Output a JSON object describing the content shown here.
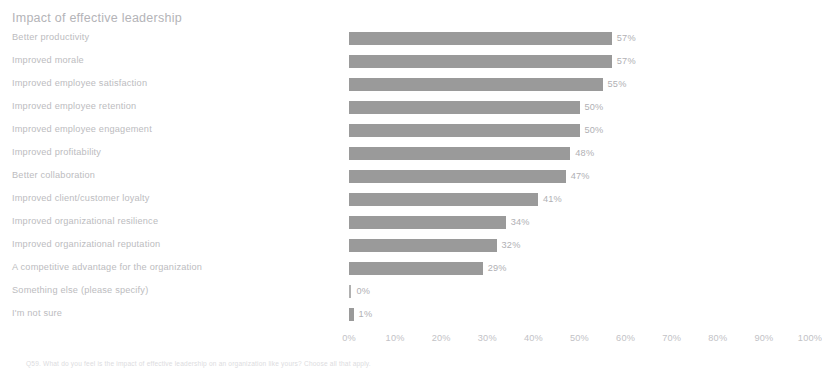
{
  "chart_data": {
    "type": "bar",
    "orientation": "horizontal",
    "title": "Impact of effective leadership",
    "xlabel": "",
    "ylabel": "",
    "xlim": [
      0,
      100
    ],
    "grid": false,
    "legend": null,
    "bar_color": "#9a9a9a",
    "categories": [
      "Better productivity",
      "Improved morale",
      "Improved employee satisfaction",
      "Improved employee retention",
      "Improved employee engagement",
      "Improved profitability",
      "Better collaboration",
      "Improved client/customer loyalty",
      "Improved organizational resilience",
      "Improved organizational reputation",
      "A competitive advantage for the organization",
      "Something else (please specify)",
      "I'm not sure"
    ],
    "values": [
      57,
      57,
      55,
      50,
      50,
      48,
      47,
      41,
      34,
      32,
      29,
      0,
      1
    ],
    "value_labels": [
      "57%",
      "57%",
      "55%",
      "50%",
      "50%",
      "48%",
      "47%",
      "41%",
      "34%",
      "32%",
      "29%",
      "0%",
      "1%"
    ],
    "xticks": [
      0,
      10,
      20,
      30,
      40,
      50,
      60,
      70,
      80,
      90,
      100
    ],
    "xtick_labels": [
      "0%",
      "10%",
      "20%",
      "30%",
      "40%",
      "50%",
      "60%",
      "70%",
      "80%",
      "90%",
      "100%"
    ]
  },
  "footnote": "Q59. What do you feel is the impact of effective leadership on an organization like yours? Choose all that apply.",
  "clipped_fragments": [
    "",
    ""
  ]
}
